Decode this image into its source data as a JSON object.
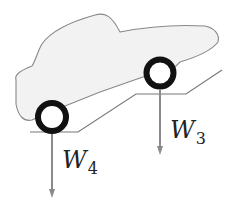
{
  "diagram": {
    "title": "",
    "colors": {
      "car_fill": "#f2f2f2",
      "car_outline": "#888888",
      "ground": "#777777",
      "wheel": "#111111",
      "arrow": "#8a8a8a",
      "text": "#222222"
    },
    "car": {
      "body_path": "M 16 80 C 14 74, 22 70, 32 66 C 36 60, 38 50, 42 44 C 50 32, 70 22, 95 15 C 105 12, 112 16, 120 32 C 140 28, 170 24, 205 26 C 215 28, 220 35, 218 42 C 212 50, 200 56, 180 62 L 176 66 L 140 78 L 100 92 L 70 104 L 60 108 C 50 112, 40 116, 32 120 C 24 122, 18 116, 16 104 Z"
    },
    "ground": {
      "path": "M 30 132 L 78 132 L 136 94 L 186 94 L 222 70"
    },
    "wheels": [
      {
        "name": "rear-wheel",
        "cx": 52,
        "cy": 117,
        "r": 14,
        "stroke": 6
      },
      {
        "name": "front-wheel",
        "cx": 160,
        "cy": 73,
        "r": 13.5,
        "stroke": 6
      }
    ],
    "forces": [
      {
        "name": "W4",
        "symbol": "W",
        "subscript": "4",
        "x": 52,
        "y1": 134,
        "y2": 198,
        "label_x": 62,
        "label_y": 148
      },
      {
        "name": "W3",
        "symbol": "W",
        "subscript": "3",
        "x": 160,
        "y1": 90,
        "y2": 155,
        "label_x": 170,
        "label_y": 118
      }
    ]
  }
}
